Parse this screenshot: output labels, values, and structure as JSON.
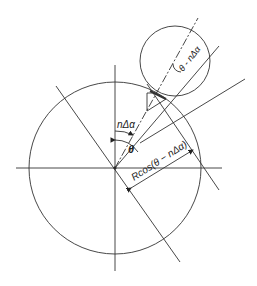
{
  "diagram": {
    "title": "",
    "labels": {
      "n_delta_alpha": "nΔα",
      "theta": "θ",
      "theta_minus_n_delta_alpha": "θ - nΔα",
      "r_cos": "Rcos(θ − nΔα)"
    },
    "colors": {
      "stroke": "#333333",
      "background": "#ffffff"
    },
    "elements": {
      "large_circle": {
        "cx": 115,
        "cy": 168,
        "r": 86
      },
      "small_circle": {
        "cx": 174,
        "cy": 61,
        "r": 35
      }
    }
  }
}
